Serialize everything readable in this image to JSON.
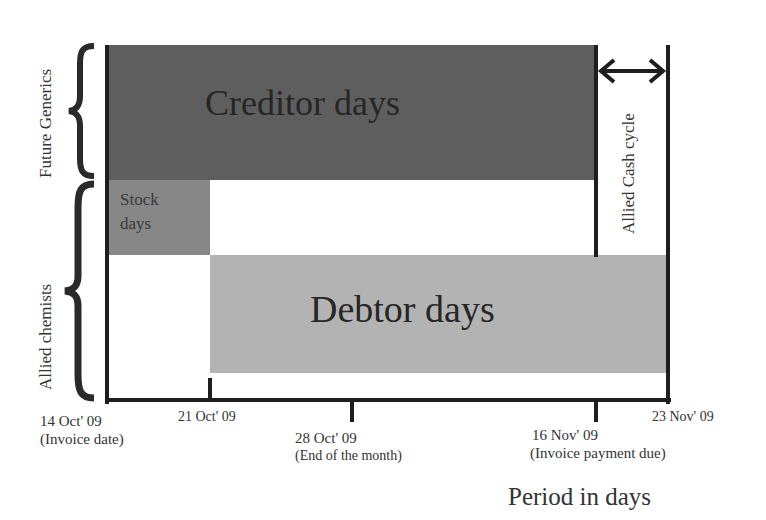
{
  "diagram": {
    "bars": {
      "creditor": {
        "label": "Creditor days",
        "color": "#5e5e5e"
      },
      "stock": {
        "label": "Stock days",
        "line1": "Stock",
        "line2": "days",
        "color": "#878787"
      },
      "debtor": {
        "label": "Debtor days",
        "color": "#b3b3b3"
      }
    },
    "groups": {
      "future_generics": "Future Generics",
      "allied_chemists": "Allied chemists"
    },
    "cash_cycle_label": "Allied Cash cycle",
    "axis": {
      "title": "Period in days",
      "ticks": [
        {
          "date": "14 Oct' 09",
          "note": "(Invoice date)"
        },
        {
          "date": "21 Oct' 09",
          "note": ""
        },
        {
          "date": "28 Oct' 09",
          "note": "(End of the month)"
        },
        {
          "date": "16 Nov' 09",
          "note": "(Invoice payment due)"
        },
        {
          "date": "23 Nov' 09",
          "note": ""
        }
      ]
    }
  }
}
